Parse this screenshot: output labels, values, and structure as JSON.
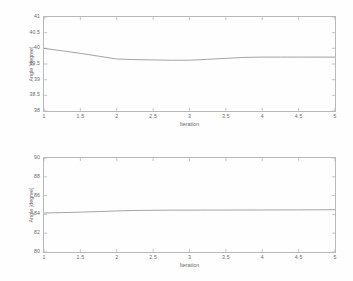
{
  "figure": {
    "background_color": "#fefefe",
    "axis_color": "#b9b9b9",
    "line_color": "#8d8d8d",
    "text_color": "#6a6a6a"
  },
  "chart_data": [
    {
      "type": "line",
      "title": "",
      "xlabel": "Iteration",
      "ylabel": "Angle [degree]",
      "xlim": [
        1,
        5
      ],
      "ylim": [
        38,
        41
      ],
      "xticks": [
        "1",
        "1.5",
        "2",
        "2.5",
        "3",
        "3.5",
        "4",
        "4.5",
        "5"
      ],
      "xtick_values": [
        1,
        1.5,
        2,
        2.5,
        3,
        3.5,
        4,
        4.5,
        5
      ],
      "yticks": [
        "38",
        "38.5",
        "39",
        "39.5",
        "40",
        "40.5",
        "41"
      ],
      "ytick_values": [
        38,
        38.5,
        39,
        39.5,
        40,
        40.5,
        41
      ],
      "grid": false,
      "legend": null,
      "series": [
        {
          "name": "angle",
          "x": [
            1,
            1.25,
            1.5,
            1.75,
            2,
            2.25,
            2.5,
            2.75,
            3,
            3.25,
            3.5,
            3.75,
            4,
            4.25,
            4.5,
            4.75,
            5
          ],
          "values": [
            40.0,
            39.92,
            39.84,
            39.75,
            39.66,
            39.64,
            39.63,
            39.62,
            39.62,
            39.65,
            39.68,
            39.71,
            39.72,
            39.72,
            39.72,
            39.72,
            39.72
          ]
        }
      ]
    },
    {
      "type": "line",
      "title": "",
      "xlabel": "Iteration",
      "ylabel": "Angle [degree]",
      "xlim": [
        1,
        5
      ],
      "ylim": [
        80,
        90
      ],
      "xticks": [
        "1",
        "1.5",
        "2",
        "2.5",
        "3",
        "3.5",
        "4",
        "4.5",
        "5"
      ],
      "xtick_values": [
        1,
        1.5,
        2,
        2.5,
        3,
        3.5,
        4,
        4.5,
        5
      ],
      "yticks": [
        "80",
        "82",
        "84",
        "86",
        "88",
        "90"
      ],
      "ytick_values": [
        80,
        82,
        84,
        86,
        88,
        90
      ],
      "grid": false,
      "legend": null,
      "series": [
        {
          "name": "angle",
          "x": [
            1,
            1.25,
            1.5,
            1.75,
            2,
            2.25,
            2.5,
            2.75,
            3,
            3.25,
            3.5,
            3.75,
            4,
            4.25,
            4.5,
            4.75,
            5
          ],
          "values": [
            84.15,
            84.19,
            84.24,
            84.3,
            84.37,
            84.42,
            84.44,
            84.45,
            84.45,
            84.46,
            84.46,
            84.47,
            84.47,
            84.48,
            84.48,
            84.49,
            84.5
          ]
        }
      ]
    }
  ]
}
